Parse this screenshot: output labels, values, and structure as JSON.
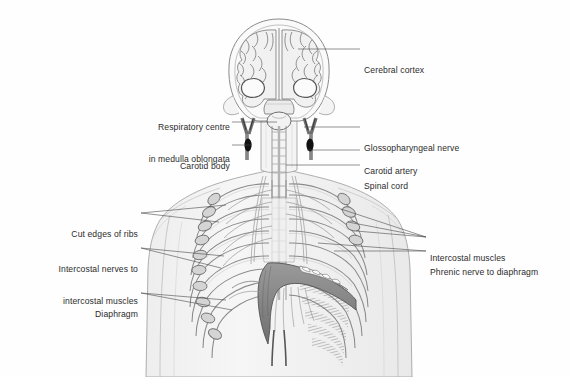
{
  "figure": {
    "background_color": "#fefefe",
    "body_fill": "#f2f2f2",
    "outline_color": "#8a8a8a",
    "leader_color": "#4a4a4a",
    "text_color": "#2b2b2b",
    "diaphragm_fill": "#8a8a8a",
    "carotid_body_fill": "#111111"
  },
  "labels": {
    "left": [
      {
        "id": "respiratory-centre",
        "line1": "Respiratory centre",
        "line2": "in medulla oblongata",
        "x": 92,
        "y": 101,
        "width": 138,
        "leader_from_x": 232,
        "leader_from_y": 122,
        "leader_to_x": 277,
        "leader_to_y": 122
      },
      {
        "id": "carotid-body",
        "line1": "Carotid body",
        "line2": "",
        "x": 112,
        "y": 140,
        "width": 118,
        "leader_from_x": 232,
        "leader_from_y": 145,
        "leader_to_x": 253,
        "leader_to_y": 145
      },
      {
        "id": "cut-edges-of-ribs",
        "line1": "Cut edges of ribs",
        "line2": "",
        "x": 28,
        "y": 208,
        "width": 110,
        "leader_from_x": 141,
        "leader_from_y": 213,
        "leader_to_x": 226,
        "leader_to_y": 205
      },
      {
        "id": "intercostal-nerves",
        "line1": "Intercostal nerves to",
        "line2": "intercostal muscles",
        "x": 15,
        "y": 243,
        "width": 123,
        "leader_from_x": 141,
        "leader_from_y": 248,
        "leader_to_x": 222,
        "leader_to_y": 258
      },
      {
        "id": "diaphragm",
        "line1": "Diaphragm",
        "line2": "",
        "x": 58,
        "y": 288,
        "width": 80,
        "leader_from_x": 141,
        "leader_from_y": 293,
        "leader_to_x": 225,
        "leader_to_y": 300
      }
    ],
    "right": [
      {
        "id": "cerebral-cortex",
        "line1": "Cerebral cortex",
        "line2": "",
        "x": 364,
        "y": 44,
        "leader_from_x": 300,
        "leader_from_y": 49,
        "leader_to_x": 360,
        "leader_to_y": 49
      },
      {
        "id": "glossopharyngeal-nerve",
        "line1": "Glossopharyngeal nerve",
        "line2": "",
        "x": 364,
        "y": 122,
        "leader_from_x": 303,
        "leader_from_y": 127,
        "leader_to_x": 360,
        "leader_to_y": 127
      },
      {
        "id": "carotid-artery",
        "line1": "Carotid artery",
        "line2": "",
        "x": 364,
        "y": 145,
        "leader_from_x": 305,
        "leader_from_y": 150,
        "leader_to_x": 360,
        "leader_to_y": 150
      },
      {
        "id": "spinal-cord",
        "line1": "Spinal cord",
        "line2": "",
        "x": 364,
        "y": 160,
        "leader_from_x": 286,
        "leader_from_y": 165,
        "leader_to_x": 360,
        "leader_to_y": 165
      },
      {
        "id": "intercostal-muscles",
        "line1": "Intercostal muscles",
        "line2": "",
        "x": 430,
        "y": 232,
        "leader_from_x": 360,
        "leader_from_y": 237,
        "leader_to_x": 426,
        "leader_to_y": 237
      },
      {
        "id": "phrenic-nerve",
        "line1": "Phrenic nerve to diaphragm",
        "line2": "",
        "x": 430,
        "y": 246,
        "leader_from_x": 335,
        "leader_from_y": 251,
        "leader_to_x": 426,
        "leader_to_y": 251
      }
    ]
  },
  "anatomy": {
    "structures": [
      "skull-coronal-section",
      "cerebral-cortex-gyri",
      "lateral-ventricles",
      "medulla-oblongata",
      "carotid-arteries",
      "carotid-bodies",
      "glossopharyngeal-nerves",
      "cervical-spine",
      "spinal-cord",
      "rib-cage",
      "cut-rib-edges",
      "intercostal-muscles",
      "intercostal-nerves",
      "phrenic-nerves",
      "diaphragm",
      "torso-silhouette"
    ],
    "rib_pair_count": 10
  }
}
